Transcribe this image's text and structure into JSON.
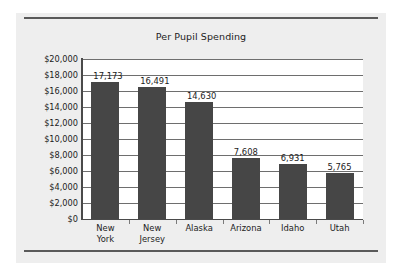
{
  "chart_data": {
    "type": "bar",
    "title": "Per Pupil Spending",
    "xlabel": "",
    "ylabel": "",
    "categories": [
      "New York",
      "New Jersey",
      "Alaska",
      "Arizona",
      "Idaho",
      "Utah"
    ],
    "category_lines": [
      [
        "New",
        "York"
      ],
      [
        "New",
        "Jersey"
      ],
      [
        "Alaska"
      ],
      [
        "Arizona"
      ],
      [
        "Idaho"
      ],
      [
        "Utah"
      ]
    ],
    "values": [
      17173,
      16491,
      14630,
      7608,
      6931,
      5765
    ],
    "value_labels": [
      "17,173",
      "16,491",
      "14,630",
      "7,608",
      "6,931",
      "5,765"
    ],
    "ylim": [
      0,
      20000
    ],
    "ytick_step": 2000,
    "ytick_labels": [
      "$20,000",
      "$18,000",
      "$16,000",
      "$14,000",
      "$12,000",
      "$10,000",
      "$8,000",
      "$6,000",
      "$4,000",
      "$2,000",
      "$0"
    ],
    "ytick_values": [
      20000,
      18000,
      16000,
      14000,
      12000,
      10000,
      8000,
      6000,
      4000,
      2000,
      0
    ],
    "grid": true,
    "legend": false,
    "bar_color": "#464646",
    "plot_background": "#ffffff",
    "panel_background": "#eeeeee",
    "grid_color": "#6e6e6e",
    "axis_color": "#4a4a4a",
    "text_color": "#1c1c1c"
  }
}
